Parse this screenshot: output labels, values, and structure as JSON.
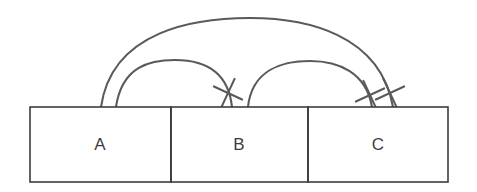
{
  "figure": {
    "type": "sequence-segment-diagram",
    "background_color": "#ffffff",
    "line_color": "#5a5a5a",
    "box_stroke_color": "#3d3d3d",
    "label_color": "#3d3d3d"
  },
  "segments": [
    {
      "label": "A",
      "x": 30,
      "width": 141,
      "center_x": 100
    },
    {
      "label": "B",
      "x": 171,
      "width": 137,
      "center_x": 239
    },
    {
      "label": "C",
      "x": 308,
      "width": 140,
      "center_x": 378
    }
  ],
  "track": {
    "x": 30,
    "y": 107,
    "width": 418,
    "height": 75
  },
  "arcs": [
    {
      "name": "arc-a-to-c",
      "from_segment": "A",
      "to_segment": "C",
      "start_x": 101,
      "end_x": 393,
      "baseline_y": 107,
      "peak_y": 18,
      "crossed": true
    },
    {
      "name": "arc-a-to-b",
      "from_segment": "A",
      "to_segment": "B",
      "start_x": 116,
      "end_x": 232,
      "baseline_y": 107,
      "peak_y": 60,
      "crossed": true
    },
    {
      "name": "arc-b-to-c",
      "from_segment": "B",
      "to_segment": "C",
      "start_x": 248,
      "end_x": 372,
      "baseline_y": 107,
      "peak_y": 61,
      "crossed": true
    }
  ],
  "cross_marks": [
    {
      "name": "cross-on-arc-a-to-b",
      "x": 228,
      "y": 93,
      "size": 11,
      "rotation": -20
    },
    {
      "name": "cross-on-arc-b-to-c",
      "x": 370,
      "y": 95,
      "size": 11,
      "rotation": 20
    },
    {
      "name": "cross-on-arc-a-to-c",
      "x": 390,
      "y": 93,
      "size": 11,
      "rotation": 20
    }
  ],
  "labels": {
    "a": "A",
    "b": "B",
    "c": "C"
  }
}
